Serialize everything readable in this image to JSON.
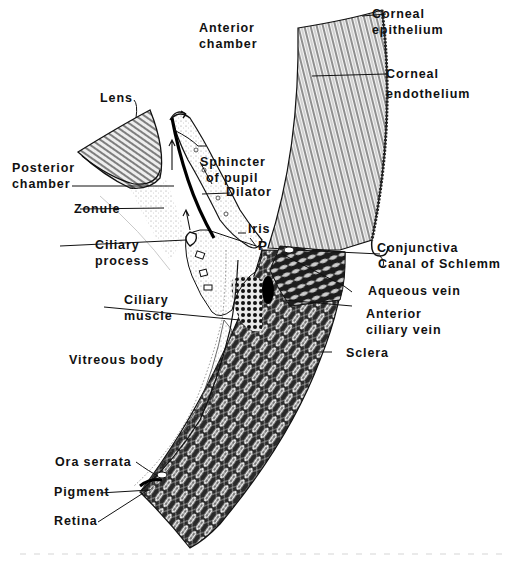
{
  "figure": {
    "colors": {
      "ink": "#111111",
      "background": "#ffffff",
      "stipple": "#9a9a9a"
    },
    "labels": {
      "anterior_chamber": [
        "Anterior",
        "chamber"
      ],
      "corneal_epithelium": [
        "Corneal",
        "epithelium"
      ],
      "corneal_endothelium": [
        "Corneal",
        "endothelium"
      ],
      "lens": "Lens",
      "posterior_chamber": [
        "Posterior",
        "chamber"
      ],
      "sphincter_of_pupil": [
        "Sphincter",
        "of pupil"
      ],
      "dilator": "Dilator",
      "zonule": "Zonule",
      "iris": "Iris",
      "p_marker": "P",
      "ciliary_process": [
        "Ciliary",
        "process"
      ],
      "conjunctiva": "Conjunctiva",
      "canal_of_schlemm": "Canal of Schlemm",
      "aqueous_vein": "Aqueous vein",
      "ciliary_muscle": [
        "Ciliary",
        "muscle"
      ],
      "anterior_ciliary_vein": [
        "Anterior",
        "ciliary vein"
      ],
      "sclera": "Sclera",
      "vitreous_body": "Vitreous body",
      "ora_serrata": "Ora serrata",
      "pigment": "Pigment",
      "retina": "Retina"
    }
  }
}
